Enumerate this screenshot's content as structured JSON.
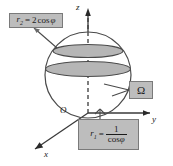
{
  "figure": {
    "background_color": "#ffffff",
    "line_color": "#3a3a3a",
    "shade_color": "#b9b9b9",
    "box_fill": "#bdbdbd",
    "box_border": "#7a7a7a"
  },
  "axes": {
    "z": {
      "label": "z",
      "direction": "up"
    },
    "y": {
      "label": "y",
      "direction": "right"
    },
    "x": {
      "label": "x",
      "direction": "down-left"
    },
    "origin": {
      "label": "O"
    }
  },
  "callouts": {
    "r2": {
      "name": "r2-equation",
      "var": "r",
      "sub": "2",
      "equals": "=",
      "rhs_coefficient": "2",
      "rhs_function": "cos",
      "rhs_angle": "φ",
      "full_text": "r₂ = 2cos φ"
    },
    "omega": {
      "name": "omega-region",
      "symbol": "Ω"
    },
    "r1": {
      "name": "r1-equation",
      "var": "r",
      "sub": "1",
      "equals": "=",
      "numerator": "1",
      "denominator_function": "cos",
      "denominator_angle": "φ",
      "full_text": "r₁ = 1 / cos φ"
    }
  },
  "shapes": {
    "sphere": {
      "name": "sphere-outline",
      "cx": 88,
      "cy": 75,
      "r": 43
    },
    "upper_band": {
      "name": "upper-latitude-ellipse",
      "cy": 51
    },
    "lower_band": {
      "name": "lower-latitude-ellipse",
      "cy": 68
    }
  }
}
